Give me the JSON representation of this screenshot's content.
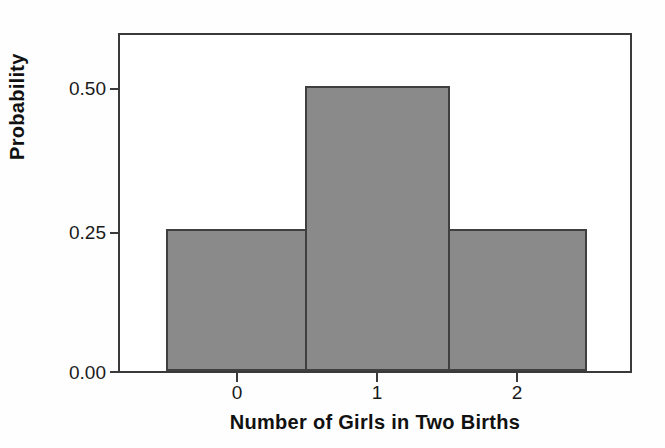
{
  "chart_data": {
    "type": "bar",
    "title": "",
    "subtitle": "",
    "xlabel": "Number of Girls in Two Births",
    "ylabel": "Probability",
    "categories": [
      "0",
      "1",
      "2"
    ],
    "values": [
      0.25,
      0.5,
      0.25
    ],
    "series": [
      {
        "name": "Probability",
        "values": [
          0.25,
          0.5,
          0.25
        ]
      }
    ],
    "ylim": [
      0.0,
      0.59
    ],
    "xlim": [
      -0.5,
      2.5
    ],
    "ytick_labels": [
      "0.50",
      "0.25",
      "0.00"
    ],
    "ytick_values": [
      0.5,
      0.25,
      0.0
    ],
    "xtick_labels": [
      "0",
      "1",
      "2"
    ],
    "grid": false,
    "legend": null,
    "legend_position": "none",
    "annotations": [],
    "bar_fill_color": "#8a8a8a",
    "bar_edge_color": "#3f3f3f",
    "frame_color": "#3a3a3a",
    "background_color": "#fefefe"
  }
}
